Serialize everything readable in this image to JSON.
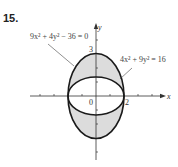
{
  "problem_number": "15.",
  "equations": {
    "outer": "9x² + 4y² − 36 = 0",
    "inner": "4x² + 9y² = 16"
  },
  "axes": {
    "x_label": "x",
    "y_label": "y",
    "origin_label": "0",
    "x_tick_label": "2",
    "y_tick_label": "3"
  },
  "colors": {
    "shade": "#dcdcdc",
    "curve": "#1a1a1a",
    "axis": "#333333"
  }
}
